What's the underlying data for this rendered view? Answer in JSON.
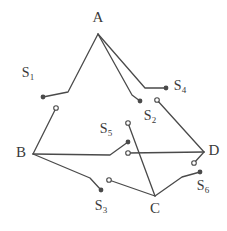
{
  "figure": {
    "type": "switching-network-graph",
    "stroke_color": "#4a4a4a",
    "label_color": "#3a3a3a",
    "background": "#ffffff"
  },
  "nodes": [
    {
      "id": "A",
      "label": "A",
      "label_x": 98,
      "label_y": 19,
      "x": 98,
      "y": 34
    },
    {
      "id": "B",
      "label": "B",
      "label_x": 21,
      "label_y": 154,
      "x": 33,
      "y": 154
    },
    {
      "id": "C",
      "label": "C",
      "label_x": 155,
      "label_y": 210,
      "x": 155,
      "y": 196
    },
    {
      "id": "D",
      "label": "D",
      "label_x": 214,
      "label_y": 152,
      "x": 204,
      "y": 152
    }
  ],
  "switches": [
    {
      "id": "S1",
      "label": "S",
      "subscript": "1",
      "label_x": 28,
      "label_y": 74,
      "dot_x": 43,
      "dot_y": 97,
      "circle_x": 56,
      "circle_y": 108
    },
    {
      "id": "S2",
      "label": "S",
      "subscript": "2",
      "label_x": 150,
      "label_y": 117,
      "dot_x": 140,
      "dot_y": 101,
      "circle_x": 128,
      "circle_y": 123
    },
    {
      "id": "S3",
      "label": "S",
      "subscript": "3",
      "label_x": 101,
      "label_y": 207,
      "dot_x": 101,
      "dot_y": 190,
      "circle_x": 109,
      "circle_y": 180
    },
    {
      "id": "S4",
      "label": "S",
      "subscript": "4",
      "label_x": 180,
      "label_y": 87,
      "dot_x": 166,
      "dot_y": 88,
      "circle_x": 157,
      "circle_y": 100
    },
    {
      "id": "S5",
      "label": "S",
      "subscript": "5",
      "label_x": 106,
      "label_y": 130,
      "dot_x": 128,
      "dot_y": 142,
      "circle_x": 128,
      "circle_y": 153
    },
    {
      "id": "S6",
      "label": "S",
      "subscript": "6",
      "label_x": 203,
      "label_y": 187,
      "dot_x": 200,
      "dot_y": 172,
      "circle_x": 194,
      "circle_y": 163
    }
  ],
  "edges": [
    {
      "name": "A-to-S1",
      "points": "98,34 68,92 43,97"
    },
    {
      "name": "A-to-S2",
      "points": "98,34 132,95 140,101"
    },
    {
      "name": "A-to-S4",
      "points": "98,34 145,88 166,88"
    },
    {
      "name": "S1-circle-to-B",
      "points": "56,108 33,154"
    },
    {
      "name": "B-to-S5",
      "points": "33,154 110,155 128,142"
    },
    {
      "name": "B-to-S3",
      "points": "33,154 90,178 101,190"
    },
    {
      "name": "S5-circle-to-D",
      "points": "128,153 204,152"
    },
    {
      "name": "S4-circle-to-D",
      "points": "157,100 204,152"
    },
    {
      "name": "S2-circle-to-C",
      "points": "128,123 155,196"
    },
    {
      "name": "S3-circle-to-C",
      "points": "109,180 155,196"
    },
    {
      "name": "C-to-S6",
      "points": "155,196 182,177 200,172"
    },
    {
      "name": "S6-circle-to-D",
      "points": "194,163 204,152"
    }
  ]
}
